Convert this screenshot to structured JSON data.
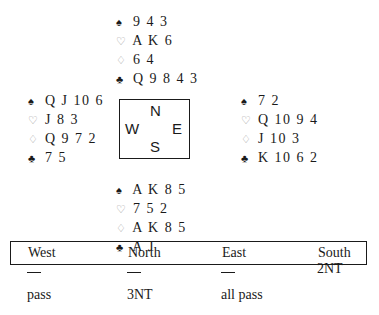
{
  "deal": {
    "north": {
      "spades": "9 4 3",
      "hearts": "A K 6",
      "diamonds": "6 4",
      "clubs": "Q 9 8 4 3"
    },
    "west": {
      "spades": "Q J 10 6",
      "hearts": "J 8 3",
      "diamonds": "Q 9 7 2",
      "clubs": "7 5"
    },
    "east": {
      "spades": "7 2",
      "hearts": "Q 10 9 4",
      "diamonds": "J 10 3",
      "clubs": "K 10 6 2"
    },
    "south": {
      "spades": "A K 8 5",
      "hearts": "7 5 2",
      "diamonds": "A K 8 5",
      "clubs": "A J"
    }
  },
  "icons": {
    "spades": "♠",
    "hearts": "♡",
    "diamonds": "♢",
    "clubs": "♣"
  },
  "compass": {
    "north": "N",
    "west": "W",
    "east": "E",
    "south": "S"
  },
  "auction": {
    "headers": [
      "West",
      "North",
      "East",
      "South"
    ],
    "rows": [
      [
        "—",
        "—",
        "—",
        "2NT"
      ],
      [
        "pass",
        "3NT",
        "all pass",
        ""
      ]
    ]
  }
}
